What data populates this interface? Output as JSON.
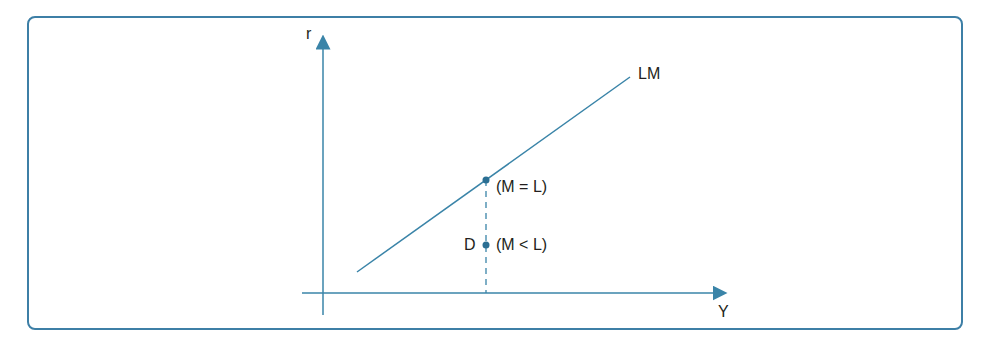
{
  "diagram": {
    "axes": {
      "y_label": "r",
      "x_label": "Y"
    },
    "curve_label": "LM",
    "points": [
      {
        "label": "(M = L)",
        "description": "point on LM curve"
      },
      {
        "label": "(M < L)",
        "name": "D",
        "description": "point below LM curve"
      }
    ],
    "colors": {
      "frame": "#3d7fa6",
      "axis": "#3a84a8",
      "curve": "#3a84a8",
      "text": "#231f20"
    }
  }
}
